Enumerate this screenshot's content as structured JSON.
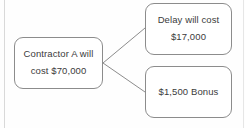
{
  "diagram": {
    "type": "decision-tree",
    "background_color": "#fefefe",
    "stroke_color": "#8c8c8c",
    "text_color": "#3b3b3b",
    "nodes": [
      {
        "id": "contractor",
        "name": "contractor-node",
        "lines": [
          "Contractor A will",
          "cost $70,000"
        ],
        "x": 14,
        "y": 37,
        "width": 89,
        "height": 52
      },
      {
        "id": "delay",
        "name": "delay-cost-node",
        "lines": [
          "Delay will cost",
          "$17,000"
        ],
        "x": 145,
        "y": 3,
        "width": 87,
        "height": 52
      },
      {
        "id": "bonus",
        "name": "bonus-node",
        "lines": [
          "$1,500 Bonus"
        ],
        "x": 145,
        "y": 66,
        "width": 87,
        "height": 52
      }
    ],
    "connectors": [
      {
        "id": "contractor-to-delay",
        "from": "contractor",
        "to": "delay",
        "x1": 103,
        "y1": 63,
        "x2": 145,
        "y2": 28
      },
      {
        "id": "contractor-to-bonus",
        "from": "contractor",
        "to": "bonus",
        "x1": 103,
        "y1": 63,
        "x2": 145,
        "y2": 92
      }
    ]
  }
}
